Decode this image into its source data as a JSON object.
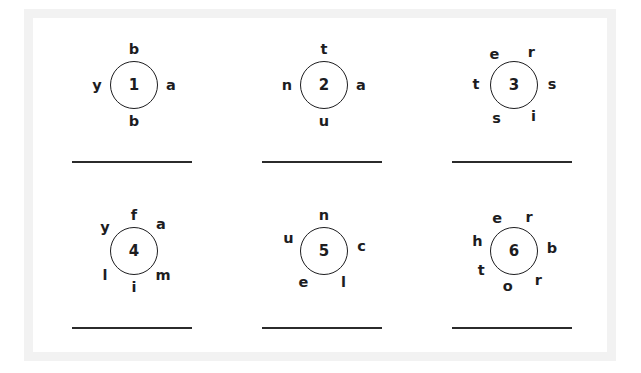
{
  "worksheet": {
    "background_color": "#ffffff",
    "frame_color": "#f2f2f2",
    "ink_color": "#1d1d1f",
    "line_color": "#2b2b2b"
  },
  "puzzles": [
    {
      "number": "1",
      "letter_count": 4,
      "letters": [
        {
          "char": "b",
          "angle": 90,
          "radius": 36
        },
        {
          "char": "a",
          "angle": 0,
          "radius": 37
        },
        {
          "char": "b",
          "angle": 270,
          "radius": 36
        },
        {
          "char": "y",
          "angle": 180,
          "radius": 37
        }
      ],
      "answer": ""
    },
    {
      "number": "2",
      "letter_count": 4,
      "letters": [
        {
          "char": "t",
          "angle": 90,
          "radius": 36
        },
        {
          "char": "a",
          "angle": 0,
          "radius": 37
        },
        {
          "char": "u",
          "angle": 270,
          "radius": 36
        },
        {
          "char": "n",
          "angle": 180,
          "radius": 37
        }
      ],
      "answer": ""
    },
    {
      "number": "3",
      "letter_count": 6,
      "letters": [
        {
          "char": "e",
          "angle": 122,
          "radius": 37
        },
        {
          "char": "r",
          "angle": 62,
          "radius": 37
        },
        {
          "char": "s",
          "angle": 2,
          "radius": 38
        },
        {
          "char": "i",
          "angle": -58,
          "radius": 37
        },
        {
          "char": "s",
          "angle": -118,
          "radius": 37
        },
        {
          "char": "t",
          "angle": 178,
          "radius": 38
        }
      ],
      "answer": ""
    },
    {
      "number": "4",
      "letter_count": 6,
      "letters": [
        {
          "char": "f",
          "angle": 90,
          "radius": 36
        },
        {
          "char": "a",
          "angle": 45,
          "radius": 38
        },
        {
          "char": "m",
          "angle": -40,
          "radius": 38
        },
        {
          "char": "i",
          "angle": 270,
          "radius": 36
        },
        {
          "char": "l",
          "angle": -140,
          "radius": 38
        },
        {
          "char": "y",
          "angle": 140,
          "radius": 38
        }
      ],
      "answer": ""
    },
    {
      "number": "5",
      "letter_count": 5,
      "letters": [
        {
          "char": "n",
          "angle": 90,
          "radius": 36
        },
        {
          "char": "c",
          "angle": 8,
          "radius": 38
        },
        {
          "char": "l",
          "angle": -58,
          "radius": 37
        },
        {
          "char": "e",
          "angle": -124,
          "radius": 37
        },
        {
          "char": "u",
          "angle": 160,
          "radius": 38
        }
      ],
      "answer": ""
    },
    {
      "number": "6",
      "letter_count": 7,
      "letters": [
        {
          "char": "e",
          "angle": 117,
          "radius": 37
        },
        {
          "char": "r",
          "angle": 66,
          "radius": 37
        },
        {
          "char": "b",
          "angle": 4,
          "radius": 38
        },
        {
          "char": "r",
          "angle": -50,
          "radius": 38
        },
        {
          "char": "o",
          "angle": -100,
          "radius": 36
        },
        {
          "char": "t",
          "angle": -150,
          "radius": 38
        },
        {
          "char": "h",
          "angle": 165,
          "radius": 38
        }
      ],
      "answer": ""
    }
  ]
}
